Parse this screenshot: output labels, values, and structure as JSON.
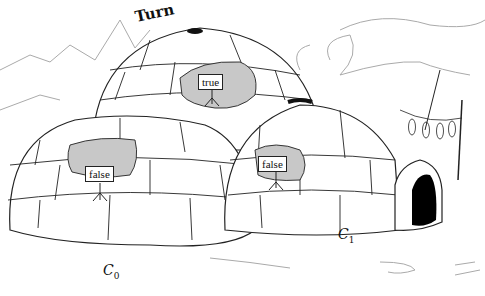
{
  "figure": {
    "title_label": "Turn",
    "igloos": [
      {
        "id": "top",
        "flag_value": "true",
        "caption": ""
      },
      {
        "id": "C0",
        "flag_value": "false",
        "caption_main": "C",
        "caption_sub": "0"
      },
      {
        "id": "C1",
        "flag_value": "false",
        "caption_main": "C",
        "caption_sub": "1"
      }
    ],
    "fish_count": 4,
    "colors": {
      "line": "#222222",
      "shade": "#c8c8c8",
      "background_sketch": "#aaaaaa",
      "door": "#000000"
    }
  }
}
